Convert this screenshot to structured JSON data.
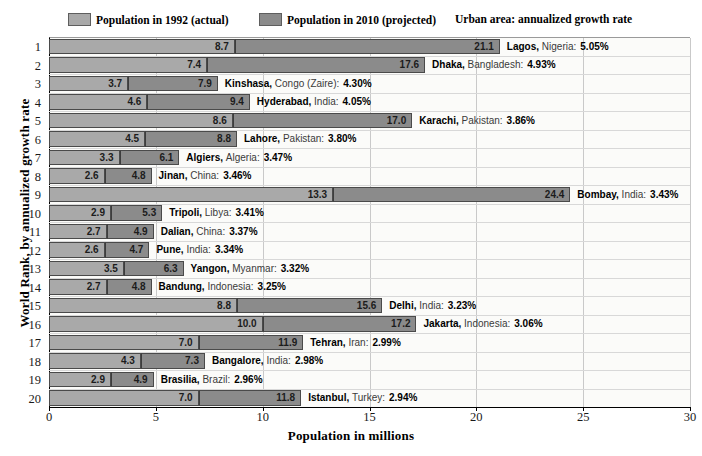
{
  "chart_data": {
    "type": "bar",
    "orientation": "horizontal",
    "stacked": true,
    "title": "",
    "xlabel": "Population in millions",
    "ylabel": "World Rank, by annualized growth rate",
    "xlim": [
      0,
      30
    ],
    "xticks": [
      0,
      5,
      10,
      15,
      20,
      25,
      30
    ],
    "xtick_labels": [
      "0",
      "5",
      "10",
      "15",
      "20",
      "25",
      "30"
    ],
    "grid": "vertical",
    "legend_position": "top",
    "legend": [
      {
        "label": "Population in 1992 (actual)",
        "color": "#a9a9a9",
        "key": "pop_1992"
      },
      {
        "label": "Population in 2010 (projected)",
        "color": "#8b8b8b",
        "key": "pop_2010"
      }
    ],
    "legend_note": "Urban area:  annualized growth rate",
    "categories": [
      "1",
      "2",
      "3",
      "4",
      "5",
      "6",
      "7",
      "8",
      "9",
      "10",
      "11",
      "12",
      "13",
      "14",
      "15",
      "16",
      "17",
      "18",
      "19",
      "20"
    ],
    "series": [
      {
        "name": "Population in 1992 (actual)",
        "values": [
          8.7,
          7.4,
          3.7,
          4.6,
          8.6,
          4.5,
          3.3,
          2.6,
          13.3,
          2.9,
          2.7,
          2.6,
          3.5,
          2.7,
          8.8,
          10.0,
          7.0,
          4.3,
          2.9,
          7.0
        ]
      },
      {
        "name": "Population in 2010 (projected)",
        "values": [
          21.1,
          17.6,
          7.9,
          9.4,
          17.0,
          8.8,
          6.1,
          4.8,
          24.4,
          5.3,
          4.9,
          4.7,
          6.3,
          4.8,
          15.6,
          17.2,
          11.9,
          7.3,
          4.9,
          11.8
        ]
      }
    ],
    "rows": [
      {
        "rank": "1",
        "city": "Lagos",
        "country": "Nigeria",
        "rate": "5.05%",
        "pop_1992": "8.7",
        "pop_2010": "21.1"
      },
      {
        "rank": "2",
        "city": "Dhaka",
        "country": "Bangladesh",
        "rate": "4.93%",
        "pop_1992": "7.4",
        "pop_2010": "17.6"
      },
      {
        "rank": "3",
        "city": "Kinshasa",
        "country": "Congo (Zaire)",
        "rate": "4.30%",
        "pop_1992": "3.7",
        "pop_2010": "7.9"
      },
      {
        "rank": "4",
        "city": "Hyderabad",
        "country": "India",
        "rate": "4.05%",
        "pop_1992": "4.6",
        "pop_2010": "9.4"
      },
      {
        "rank": "5",
        "city": "Karachi",
        "country": "Pakistan",
        "rate": "3.86%",
        "pop_1992": "8.6",
        "pop_2010": "17.0"
      },
      {
        "rank": "6",
        "city": "Lahore",
        "country": "Pakistan",
        "rate": "3.80%",
        "pop_1992": "4.5",
        "pop_2010": "8.8"
      },
      {
        "rank": "7",
        "city": "Algiers",
        "country": "Algeria",
        "rate": "3.47%",
        "pop_1992": "3.3",
        "pop_2010": "6.1"
      },
      {
        "rank": "8",
        "city": "Jinan",
        "country": "China",
        "rate": "3.46%",
        "pop_1992": "2.6",
        "pop_2010": "4.8"
      },
      {
        "rank": "9",
        "city": "Bombay",
        "country": "India",
        "rate": "3.43%",
        "pop_1992": "13.3",
        "pop_2010": "24.4"
      },
      {
        "rank": "10",
        "city": "Tripoli",
        "country": "Libya",
        "rate": "3.41%",
        "pop_1992": "2.9",
        "pop_2010": "5.3"
      },
      {
        "rank": "11",
        "city": "Dalian",
        "country": "China",
        "rate": "3.37%",
        "pop_1992": "2.7",
        "pop_2010": "4.9"
      },
      {
        "rank": "12",
        "city": "Pune",
        "country": "India",
        "rate": "3.34%",
        "pop_1992": "2.6",
        "pop_2010": "4.7"
      },
      {
        "rank": "13",
        "city": "Yangon",
        "country": "Myanmar",
        "rate": "3.32%",
        "pop_1992": "3.5",
        "pop_2010": "6.3"
      },
      {
        "rank": "14",
        "city": "Bandung",
        "country": "Indonesia",
        "rate": "3.25%",
        "pop_1992": "2.7",
        "pop_2010": "4.8"
      },
      {
        "rank": "15",
        "city": "Delhi",
        "country": "India",
        "rate": "3.23%",
        "pop_1992": "8.8",
        "pop_2010": "15.6"
      },
      {
        "rank": "16",
        "city": "Jakarta",
        "country": "Indonesia",
        "rate": "3.06%",
        "pop_1992": "10.0",
        "pop_2010": "17.2"
      },
      {
        "rank": "17",
        "city": "Tehran",
        "country": "Iran",
        "rate": "2.99%",
        "pop_1992": "7.0",
        "pop_2010": "11.9"
      },
      {
        "rank": "18",
        "city": "Bangalore",
        "country": "India",
        "rate": "2.98%",
        "pop_1992": "4.3",
        "pop_2010": "7.3"
      },
      {
        "rank": "19",
        "city": "Brasilia",
        "country": "Brazil",
        "rate": "2.96%",
        "pop_1992": "2.9",
        "pop_2010": "4.9"
      },
      {
        "rank": "20",
        "city": "Istanbul",
        "country": "Turkey",
        "rate": "2.94%",
        "pop_1992": "7.0",
        "pop_2010": "11.8"
      }
    ]
  },
  "colors": {
    "series_1992": "#a9a9a9",
    "series_2010": "#8b8b8b",
    "bar_border": "#4a4a4a",
    "gridline": "#c9c9c9",
    "plot_background": "#fbfbf9",
    "axis": "#000000"
  }
}
